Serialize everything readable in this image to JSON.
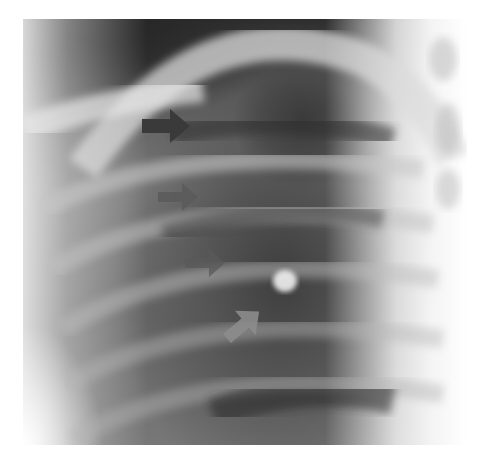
{
  "image": {
    "type": "chest radiograph",
    "view": "lateral oblique rib/lung region",
    "colorscale": "grayscale"
  },
  "annotations": [
    {
      "id": "arrow-1",
      "direction": "right",
      "color": "#3a3a3a",
      "x": 142,
      "y": 112
    },
    {
      "id": "arrow-2",
      "direction": "right",
      "color": "#5a5a5a",
      "x": 158,
      "y": 185
    },
    {
      "id": "arrow-3",
      "direction": "right",
      "color": "#5a5a5a",
      "x": 185,
      "y": 252
    },
    {
      "id": "arrow-4",
      "direction": "up-right",
      "color": "#8a8a8a",
      "x": 222,
      "y": 308
    }
  ],
  "colors": {
    "background": "#ffffff",
    "dark_lung": "#3c3c3c",
    "bone": "#e6e6e6"
  }
}
